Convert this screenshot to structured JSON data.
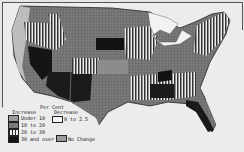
{
  "map": {
    "title": "",
    "subject": "United States — per cent change by state",
    "colors": {
      "background": "#ececec",
      "land_light": "#8a8a8a",
      "land_dark": "#1a1a1a",
      "water": "#f2f2f2",
      "border": "#555555"
    }
  },
  "legend": {
    "heading": "Per Cent",
    "increase_label": "Increase",
    "decrease_label": "Decrease",
    "increase_items": [
      {
        "label": "Under 10",
        "pattern": "grid-light"
      },
      {
        "label": "10 to 20",
        "pattern": "grid-medium"
      },
      {
        "label": "20 to 30",
        "pattern": "stripes"
      },
      {
        "label": "30 and over",
        "pattern": "solid-dark"
      }
    ],
    "decrease_items": [
      {
        "label": "0 to 2.5",
        "pattern": "white"
      }
    ],
    "no_change": {
      "label": "No Change",
      "pattern": "dotted"
    }
  }
}
